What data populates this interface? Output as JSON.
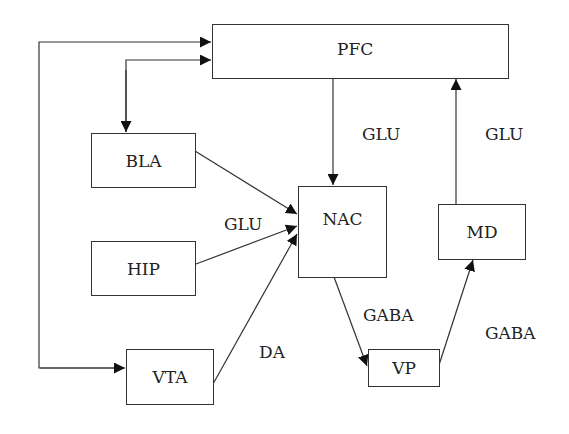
{
  "diagram": {
    "nodes": {
      "pfc": {
        "label": "PFC"
      },
      "bla": {
        "label": "BLA"
      },
      "hip": {
        "label": "HIP"
      },
      "vta": {
        "label": "VTA"
      },
      "nac": {
        "label": "NAC"
      },
      "md": {
        "label": "MD"
      },
      "vp": {
        "label": "VP"
      }
    },
    "edge_labels": {
      "pfc_nac": "GLU",
      "md_pfc": "GLU",
      "to_nac": "GLU",
      "vta_nac": "DA",
      "nac_vp": "GABA",
      "vp_md": "GABA"
    },
    "edges": [
      {
        "from": "PFC",
        "to": "NAC",
        "label": "GLU"
      },
      {
        "from": "MD",
        "to": "PFC",
        "label": "GLU"
      },
      {
        "from": "BLA",
        "to": "NAC",
        "label": "GLU"
      },
      {
        "from": "HIP",
        "to": "NAC",
        "label": "GLU"
      },
      {
        "from": "VTA",
        "to": "NAC",
        "label": "DA"
      },
      {
        "from": "NAC",
        "to": "VP",
        "label": "GABA"
      },
      {
        "from": "VP",
        "to": "MD",
        "label": "GABA"
      },
      {
        "from": "BLA",
        "to": "PFC",
        "label": "",
        "bidirectional": true
      },
      {
        "from": "VTA",
        "to": "PFC",
        "label": "",
        "bidirectional": true
      }
    ]
  }
}
